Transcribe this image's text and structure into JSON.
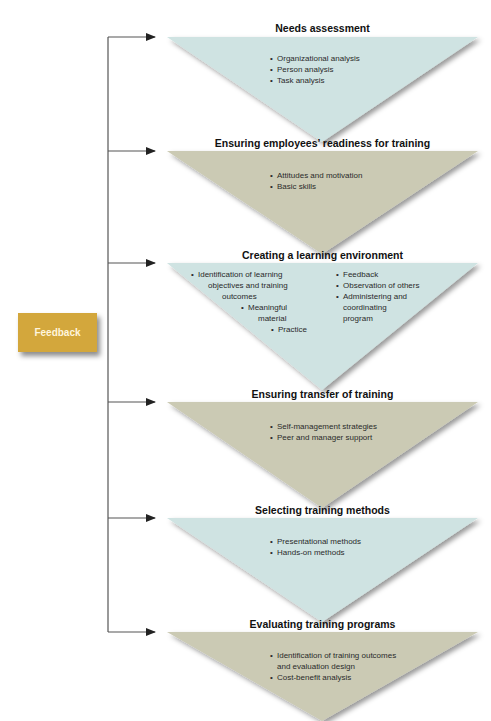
{
  "feedback": {
    "label": "Feedback",
    "color": "#d3a73c"
  },
  "colors": {
    "blue_fill": "#cfe3e2",
    "tan_fill": "#cbcab4",
    "line": "#555555"
  },
  "steps": [
    {
      "title": "Needs assessment",
      "fill": "blue",
      "bullets": [
        "Organizational analysis",
        "Person analysis",
        "Task analysis"
      ]
    },
    {
      "title": "Ensuring employees’ readiness for training",
      "fill": "tan",
      "bullets": [
        "Attitudes and motivation",
        "Basic skills"
      ]
    },
    {
      "title": "Creating a learning environment",
      "fill": "blue",
      "bullets_left": [
        "Identification of learning objectives and training outcomes",
        "Meaningful material",
        "Practice"
      ],
      "bullets_right": [
        "Feedback",
        "Observation of others",
        "Administering and coordinating program"
      ],
      "display": {
        "left_1a": "Identification of learning",
        "left_1b": "objectives and training",
        "left_1c": "outcomes",
        "left_2a": "Meaningful",
        "left_2b": "material",
        "left_3": "Practice",
        "right_1": "Feedback",
        "right_2": "Observation of others",
        "right_3a": "Administering and",
        "right_3b": "coordinating",
        "right_3c": "program"
      }
    },
    {
      "title": "Ensuring transfer of training",
      "fill": "tan",
      "bullets": [
        "Self-management strategies",
        "Peer and manager support"
      ]
    },
    {
      "title": "Selecting training methods",
      "fill": "blue",
      "bullets": [
        "Presentational methods",
        "Hands-on methods"
      ]
    },
    {
      "title": "Evaluating training programs",
      "fill": "tan",
      "bullets": [
        "Identification of training outcomes and evaluation design",
        "Cost-benefit analysis"
      ],
      "display": {
        "b1a": "Identification of training outcomes",
        "b1b": "and evaluation design"
      }
    }
  ]
}
